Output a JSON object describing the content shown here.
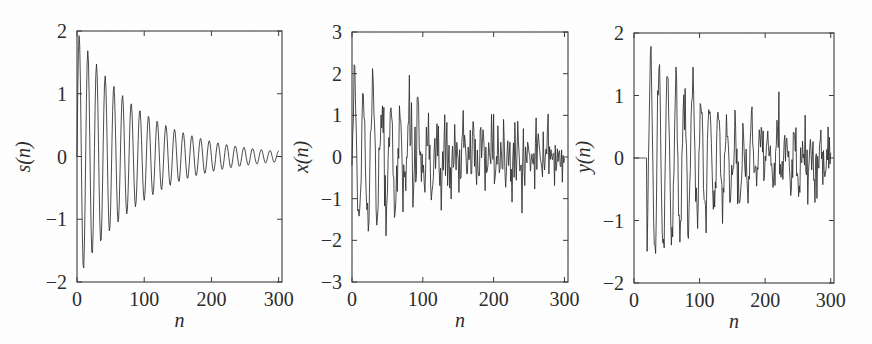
{
  "figure": {
    "kind": "signal-processing-figure",
    "panel_count": 3,
    "background_color": "#ffffff",
    "trace_color": "#2b2b2b",
    "axis_color": "#3a3a3a"
  },
  "chart_data": [
    {
      "type": "line",
      "id": "panel-s",
      "title": "",
      "xlabel": "n",
      "ylabel": "s(n)",
      "xlim": [
        0,
        305
      ],
      "ylim": [
        -2,
        2
      ],
      "xticks": [
        0,
        100,
        200,
        300
      ],
      "xticklabels": [
        "0",
        "100",
        "200",
        "300"
      ],
      "yticks": [
        -2,
        -1,
        0,
        1,
        2
      ],
      "yticklabels": [
        "-2",
        "-1",
        "0",
        "1",
        "2"
      ],
      "grid": false,
      "legend": null,
      "description": "Clean exponentially damped sinusoid s(n); amplitude starts near 1.95 at n=5 and decays toward 0.1 by n=300; period about 13 samples (roughly 23 cycles over 300 samples).",
      "model": {
        "form": "A * exp(-n/tau) * sin(2*pi*f*n + phase)",
        "amplitude": 2.0,
        "tau": 95,
        "frequency_cycles_per_sample": 0.0775,
        "phase_rad": 0.0,
        "n_start": 0,
        "n_end": 300,
        "noise_sigma": 0.0
      }
    },
    {
      "type": "line",
      "id": "panel-x",
      "title": "",
      "xlabel": "n",
      "ylabel": "x(n)",
      "xlim": [
        0,
        305
      ],
      "ylim": [
        -3,
        3
      ],
      "xticks": [
        0,
        100,
        200,
        300
      ],
      "xticklabels": [
        "0",
        "100",
        "200",
        "300"
      ],
      "yticks": [
        -3,
        -2,
        -1,
        0,
        1,
        2,
        3
      ],
      "yticklabels": [
        "-3",
        "-2",
        "-1",
        "0",
        "1",
        "2",
        "3"
      ],
      "grid": false,
      "legend": null,
      "description": "Noisy observation x(n) = s(n) + white noise; peaks reach about 2.6 near n=25 and about -2.6 near n=17; late samples fluctuate within roughly +/-1 around zero.",
      "model": {
        "form": "s(n) + white_noise",
        "amplitude": 2.0,
        "tau": 95,
        "frequency_cycles_per_sample": 0.0775,
        "phase_rad": 0.0,
        "n_start": 0,
        "n_end": 300,
        "noise_sigma": 0.42
      }
    },
    {
      "type": "line",
      "id": "panel-y",
      "title": "",
      "xlabel": "n",
      "ylabel": "y(n)",
      "xlim": [
        0,
        305
      ],
      "ylim": [
        -2,
        2
      ],
      "xticks": [
        0,
        100,
        200,
        300
      ],
      "xticklabels": [
        "0",
        "100",
        "200",
        "300"
      ],
      "yticks": [
        -2,
        -1,
        0,
        1,
        2
      ],
      "yticklabels": [
        "-2",
        "-1",
        "0",
        "1",
        "2"
      ],
      "grid": false,
      "legend": null,
      "description": "Filtered output y(n); flat at zero for the first ~20 samples (filter transient delay), then a damped oscillation with residual noise; minimum about -1.7 near n=38, maximum about 1.6 near n=48.",
      "model": {
        "form": "delayed s(n) + reduced white noise",
        "amplitude": 1.72,
        "tau": 120,
        "frequency_cycles_per_sample": 0.0775,
        "phase_rad": 0.0,
        "n_start": 20,
        "n_end": 300,
        "delay": 22,
        "noise_sigma": 0.24
      }
    }
  ]
}
